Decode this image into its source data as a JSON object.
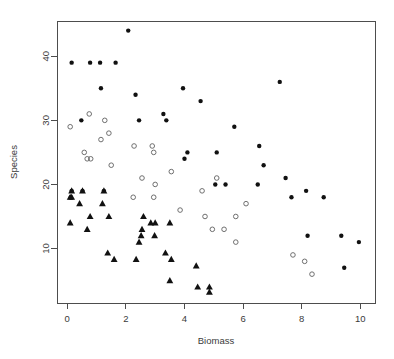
{
  "chart_data": {
    "type": "scatter",
    "title": "",
    "xlabel": "Biomass",
    "ylabel": "Species",
    "xlim": [
      -0.35,
      10.5
    ],
    "ylim": [
      1.5,
      45.5
    ],
    "xticks": [
      0,
      2,
      4,
      6,
      8,
      10
    ],
    "yticks": [
      10,
      20,
      30,
      40
    ],
    "xtick_labels": [
      "0",
      "2",
      "4",
      "6",
      "8",
      "10"
    ],
    "ytick_labels": [
      "10",
      "20",
      "30",
      "40"
    ],
    "grid": false,
    "legend": "none",
    "series": [
      {
        "name": "filled-circle-group",
        "marker": "filled-circle",
        "color": "#111111",
        "points": [
          [
            2.08,
            44
          ],
          [
            0.15,
            39
          ],
          [
            0.78,
            39
          ],
          [
            1.12,
            39
          ],
          [
            1.65,
            39
          ],
          [
            7.25,
            36
          ],
          [
            1.15,
            35
          ],
          [
            3.95,
            35
          ],
          [
            2.33,
            34
          ],
          [
            4.55,
            33
          ],
          [
            3.28,
            31
          ],
          [
            0.48,
            30
          ],
          [
            2.45,
            30
          ],
          [
            3.38,
            30
          ],
          [
            5.7,
            29
          ],
          [
            6.55,
            26
          ],
          [
            4.1,
            25
          ],
          [
            5.1,
            25
          ],
          [
            6.7,
            23
          ],
          [
            7.45,
            21
          ],
          [
            4.0,
            24
          ],
          [
            5.05,
            20
          ],
          [
            5.4,
            20
          ],
          [
            6.5,
            20
          ],
          [
            0.15,
            19
          ],
          [
            0.52,
            19
          ],
          [
            1.25,
            19
          ],
          [
            8.15,
            19
          ],
          [
            0.12,
            18
          ],
          [
            7.65,
            18
          ],
          [
            8.75,
            18
          ],
          [
            9.35,
            12
          ],
          [
            8.2,
            12
          ],
          [
            9.95,
            11
          ],
          [
            9.45,
            7
          ]
        ]
      },
      {
        "name": "open-circle-group",
        "marker": "open-circle",
        "color": "#6f6f6f",
        "points": [
          [
            0.1,
            29
          ],
          [
            0.75,
            31
          ],
          [
            1.28,
            30
          ],
          [
            1.42,
            28
          ],
          [
            1.15,
            27
          ],
          [
            2.28,
            26
          ],
          [
            2.9,
            26
          ],
          [
            0.58,
            25
          ],
          [
            2.95,
            25
          ],
          [
            0.68,
            24
          ],
          [
            0.8,
            24
          ],
          [
            1.5,
            23
          ],
          [
            3.55,
            22
          ],
          [
            2.55,
            21
          ],
          [
            5.1,
            21
          ],
          [
            3.0,
            20
          ],
          [
            2.25,
            18
          ],
          [
            2.95,
            18
          ],
          [
            4.6,
            19
          ],
          [
            3.85,
            16
          ],
          [
            6.1,
            17
          ],
          [
            4.7,
            15
          ],
          [
            5.75,
            15
          ],
          [
            4.95,
            13
          ],
          [
            5.35,
            13
          ],
          [
            5.75,
            11
          ],
          [
            7.7,
            9
          ],
          [
            8.1,
            8
          ],
          [
            8.35,
            6
          ]
        ]
      },
      {
        "name": "triangle-group",
        "marker": "filled-triangle",
        "color": "#111111",
        "points": [
          [
            0.15,
            19
          ],
          [
            0.52,
            19
          ],
          [
            1.25,
            19
          ],
          [
            0.1,
            18
          ],
          [
            0.15,
            18
          ],
          [
            0.42,
            17
          ],
          [
            1.2,
            17
          ],
          [
            0.78,
            15
          ],
          [
            1.42,
            15
          ],
          [
            2.6,
            15
          ],
          [
            0.1,
            14
          ],
          [
            2.85,
            14
          ],
          [
            3.0,
            14
          ],
          [
            3.5,
            14
          ],
          [
            0.68,
            13
          ],
          [
            2.55,
            13
          ],
          [
            2.52,
            12
          ],
          [
            2.98,
            12
          ],
          [
            2.45,
            11
          ],
          [
            1.38,
            9.3
          ],
          [
            3.35,
            9.3
          ],
          [
            1.6,
            8.3
          ],
          [
            2.35,
            8.3
          ],
          [
            3.55,
            8.3
          ],
          [
            4.4,
            7.3
          ],
          [
            3.5,
            5
          ],
          [
            4.45,
            4
          ],
          [
            4.85,
            4
          ],
          [
            4.85,
            3.2
          ]
        ]
      }
    ]
  },
  "axes": {
    "x_title": "Biomass",
    "y_title": "Species"
  }
}
